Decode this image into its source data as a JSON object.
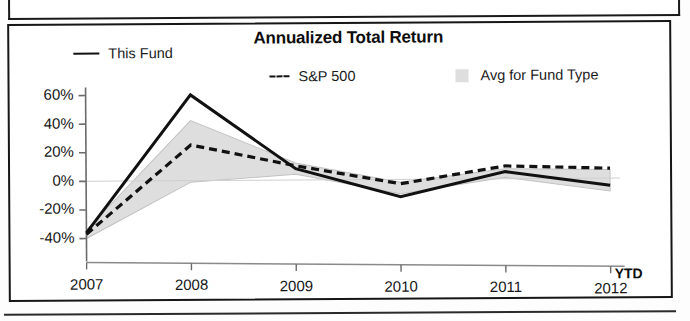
{
  "chart_panel": {
    "title": "Annualized Total Return",
    "ytd_note": "YTD"
  },
  "legend": {
    "items": [
      {
        "label": "This Fund",
        "marker": "solid-line",
        "color": "#111111"
      },
      {
        "label": "S&P 500",
        "marker": "dashed-line",
        "color": "#111111"
      },
      {
        "label": "Avg for Fund Type",
        "marker": "shaded-band",
        "color": "#dedede"
      }
    ]
  },
  "axes": {
    "y_ticks": [
      "60%",
      "40%",
      "20%",
      "0%",
      "-20%",
      "-40%"
    ],
    "x_ticks": [
      "2007",
      "2008",
      "2009",
      "2010",
      "2011",
      "2012"
    ]
  },
  "chart_data": {
    "type": "line",
    "title": "Annualized Total Return",
    "xlabel": "",
    "ylabel": "",
    "x": [
      "2007",
      "2008",
      "2009",
      "2010",
      "2011",
      "2012"
    ],
    "xtick_labels": [
      "2007",
      "2008",
      "2009",
      "2010",
      "2011",
      "2012"
    ],
    "ytick_labels": [
      "60%",
      "40%",
      "20%",
      "0%",
      "-20%",
      "-40%"
    ],
    "ylim": [
      -40,
      60
    ],
    "yticks": [
      -40,
      -20,
      0,
      20,
      40,
      60
    ],
    "grid": false,
    "legend_position": "top",
    "annotations": [
      "YTD"
    ],
    "series": [
      {
        "name": "This Fund",
        "style": "solid",
        "color": "#111111",
        "values": [
          -36,
          60,
          8,
          -12,
          5,
          -5
        ]
      },
      {
        "name": "S&P 500",
        "style": "dashed",
        "color": "#111111",
        "values": [
          -37,
          25,
          10,
          -3,
          9,
          7
        ]
      },
      {
        "name": "Avg for Fund Type",
        "style": "band",
        "color": "#dedede",
        "band_upper": [
          -34,
          42,
          12,
          -2,
          7,
          6
        ],
        "band_lower": [
          -40,
          -1,
          4,
          -10,
          1,
          -9
        ]
      }
    ]
  }
}
